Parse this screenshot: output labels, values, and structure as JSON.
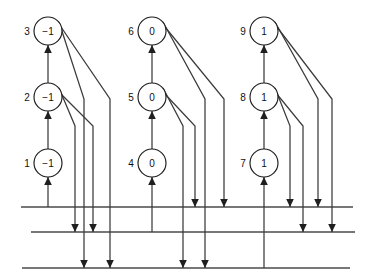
{
  "diagram": {
    "colors": {
      "background": "#ffffff",
      "node_stroke": "#1a1a1a",
      "node_fill": "#ffffff",
      "edge": "#3a3a3a",
      "bus_line": "#4a4a4a",
      "text": "#111111"
    },
    "nodes": [
      {
        "index": "1",
        "value": "−1",
        "cx": 48,
        "cy": 163,
        "r": 14,
        "label_x": 27,
        "label_y": 163
      },
      {
        "index": "2",
        "value": "−1",
        "cx": 48,
        "cy": 97,
        "r": 14,
        "label_x": 27,
        "label_y": 97
      },
      {
        "index": "3",
        "value": "−1",
        "cx": 48,
        "cy": 31,
        "r": 14,
        "label_x": 27,
        "label_y": 31
      },
      {
        "index": "4",
        "value": "0",
        "cx": 152,
        "cy": 163,
        "r": 14,
        "label_x": 131,
        "label_y": 163
      },
      {
        "index": "5",
        "value": "0",
        "cx": 152,
        "cy": 97,
        "r": 14,
        "label_x": 131,
        "label_y": 97
      },
      {
        "index": "6",
        "value": "0",
        "cx": 152,
        "cy": 31,
        "r": 14,
        "label_x": 131,
        "label_y": 31
      },
      {
        "index": "7",
        "value": "1",
        "cx": 264,
        "cy": 163,
        "r": 14,
        "label_x": 243,
        "label_y": 163
      },
      {
        "index": "8",
        "value": "1",
        "cx": 264,
        "cy": 97,
        "r": 14,
        "label_x": 243,
        "label_y": 97
      },
      {
        "index": "9",
        "value": "1",
        "cx": 264,
        "cy": 31,
        "r": 14,
        "label_x": 243,
        "label_y": 31
      }
    ],
    "bus_lines": [
      {
        "name": "bus-line-top",
        "x1": 21,
        "x2": 353,
        "y": 207
      },
      {
        "name": "bus-line-middle",
        "x1": 31,
        "x2": 355,
        "y": 232
      },
      {
        "name": "bus-line-bottom",
        "x1": 22,
        "x2": 350,
        "y": 268
      }
    ],
    "up_edges": [
      {
        "name": "edge-1-to-2",
        "x": 48,
        "y1": 149,
        "y2": 111
      },
      {
        "name": "edge-2-to-3",
        "x": 48,
        "y1": 83,
        "y2": 45
      },
      {
        "name": "edge-4-to-5",
        "x": 152,
        "y1": 149,
        "y2": 111
      },
      {
        "name": "edge-5-to-6",
        "x": 152,
        "y1": 83,
        "y2": 45
      },
      {
        "name": "edge-7-to-8",
        "x": 264,
        "y1": 149,
        "y2": 111
      },
      {
        "name": "edge-8-to-9",
        "x": 264,
        "y1": 83,
        "y2": 45
      }
    ],
    "bus_feed_edges": [
      {
        "name": "feed-bus-top-from-node-1",
        "x": 48,
        "y1": 207,
        "y2": 177
      },
      {
        "name": "feed-bus-top-from-node-4",
        "x": 152,
        "y1": 232,
        "y2": 177
      },
      {
        "name": "feed-bus-bottom-from-node-7",
        "x": 264,
        "y1": 268,
        "y2": 177
      }
    ],
    "diagonal_edges": [
      {
        "name": "out-node-2-to-bus-middle-a",
        "sx": 59,
        "sy": 88,
        "bx": 75,
        "by": 126,
        "ex": 75,
        "ey": 232
      },
      {
        "name": "out-node-2-to-bus-middle-b",
        "sx": 60,
        "sy": 93,
        "bx": 93,
        "by": 126,
        "ex": 93,
        "ey": 232
      },
      {
        "name": "out-node-3-to-bus-bottom-a",
        "sx": 59,
        "sy": 22,
        "bx": 84,
        "by": 99,
        "ex": 84,
        "ey": 268
      },
      {
        "name": "out-node-3-to-bus-bottom-b",
        "sx": 61,
        "sy": 27,
        "bx": 110,
        "by": 99,
        "ex": 110,
        "ey": 268
      },
      {
        "name": "out-node-5-to-bus-bottom-a",
        "sx": 163,
        "sy": 88,
        "bx": 183,
        "by": 126,
        "ex": 183,
        "ey": 268
      },
      {
        "name": "out-node-5-to-bus-top-a",
        "sx": 164,
        "sy": 93,
        "bx": 195,
        "by": 126,
        "ex": 195,
        "ey": 207
      },
      {
        "name": "out-node-6-to-bus-bottom-b",
        "sx": 163,
        "sy": 22,
        "bx": 205,
        "by": 99,
        "ex": 205,
        "ey": 268
      },
      {
        "name": "out-node-6-to-bus-top-b",
        "sx": 165,
        "sy": 27,
        "bx": 224,
        "by": 99,
        "ex": 224,
        "ey": 207
      },
      {
        "name": "out-node-8-to-bus-top-a",
        "sx": 275,
        "sy": 88,
        "bx": 290,
        "by": 126,
        "ex": 290,
        "ey": 207
      },
      {
        "name": "out-node-8-to-bus-middle-a",
        "sx": 276,
        "sy": 93,
        "bx": 303,
        "by": 126,
        "ex": 303,
        "ey": 232
      },
      {
        "name": "out-node-9-to-bus-top-b",
        "sx": 275,
        "sy": 22,
        "bx": 318,
        "by": 99,
        "ex": 318,
        "ey": 207
      },
      {
        "name": "out-node-9-to-bus-middle-b",
        "sx": 277,
        "sy": 27,
        "bx": 332,
        "by": 99,
        "ex": 332,
        "ey": 232
      }
    ],
    "up_arrowheads": [
      {
        "name": "arrowhead-up-into-node-1",
        "x": 48,
        "y": 177
      },
      {
        "name": "arrowhead-up-into-node-2",
        "x": 48,
        "y": 111
      },
      {
        "name": "arrowhead-up-into-node-3",
        "x": 48,
        "y": 45
      },
      {
        "name": "arrowhead-up-into-node-4",
        "x": 152,
        "y": 177
      },
      {
        "name": "arrowhead-up-into-node-5",
        "x": 152,
        "y": 111
      },
      {
        "name": "arrowhead-up-into-node-6",
        "x": 152,
        "y": 45
      },
      {
        "name": "arrowhead-up-into-node-7",
        "x": 264,
        "y": 177
      },
      {
        "name": "arrowhead-up-into-node-8",
        "x": 264,
        "y": 111
      },
      {
        "name": "arrowhead-up-into-node-9",
        "x": 264,
        "y": 45
      }
    ],
    "down_arrowheads": [
      {
        "name": "arrowhead-down-bus-middle-x75",
        "x": 75,
        "y": 232
      },
      {
        "name": "arrowhead-down-bus-middle-x93",
        "x": 93,
        "y": 232
      },
      {
        "name": "arrowhead-down-bus-bottom-x84",
        "x": 84,
        "y": 268
      },
      {
        "name": "arrowhead-down-bus-bottom-x110",
        "x": 110,
        "y": 268
      },
      {
        "name": "arrowhead-down-bus-top-x195",
        "x": 195,
        "y": 207
      },
      {
        "name": "arrowhead-down-bus-top-x224",
        "x": 224,
        "y": 207
      },
      {
        "name": "arrowhead-down-bus-bottom-x183",
        "x": 183,
        "y": 268
      },
      {
        "name": "arrowhead-down-bus-bottom-x205",
        "x": 205,
        "y": 268
      },
      {
        "name": "arrowhead-down-bus-top-x290",
        "x": 290,
        "y": 207
      },
      {
        "name": "arrowhead-down-bus-top-x318",
        "x": 318,
        "y": 207
      },
      {
        "name": "arrowhead-down-bus-middle-x303",
        "x": 303,
        "y": 232
      },
      {
        "name": "arrowhead-down-bus-middle-x332",
        "x": 332,
        "y": 232
      }
    ]
  }
}
